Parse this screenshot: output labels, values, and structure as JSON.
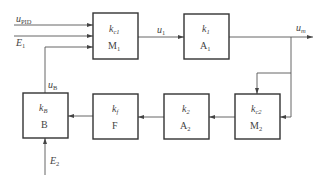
{
  "diagram": {
    "type": "block-diagram",
    "colors": {
      "stroke": "#333333",
      "wire": "#555555",
      "text": "#444444",
      "background": "#ffffff"
    },
    "blocks": [
      {
        "id": "M1",
        "gain": "k",
        "gain_sub": "c1",
        "name": "M",
        "name_sub": "1"
      },
      {
        "id": "A1",
        "gain": "k",
        "gain_sub": "1",
        "name": "A",
        "name_sub": "1"
      },
      {
        "id": "M2",
        "gain": "k",
        "gain_sub": "c2",
        "name": "M",
        "name_sub": "2"
      },
      {
        "id": "A2",
        "gain": "k",
        "gain_sub": "2",
        "name": "A",
        "name_sub": "2"
      },
      {
        "id": "F",
        "gain": "k",
        "gain_sub": "f",
        "name": "F",
        "name_sub": ""
      },
      {
        "id": "B",
        "gain": "k",
        "gain_sub": "B",
        "name": "B",
        "name_sub": ""
      }
    ],
    "signals": {
      "u_pid": {
        "base": "u",
        "sub": "PID"
      },
      "e1": {
        "base": "E",
        "sub": "1"
      },
      "u_b": {
        "base": "u",
        "sub": "B"
      },
      "u1": {
        "base": "u",
        "sub": "1"
      },
      "u_m": {
        "base": "u",
        "sub": "m"
      },
      "e2": {
        "base": "E",
        "sub": "2"
      }
    }
  }
}
